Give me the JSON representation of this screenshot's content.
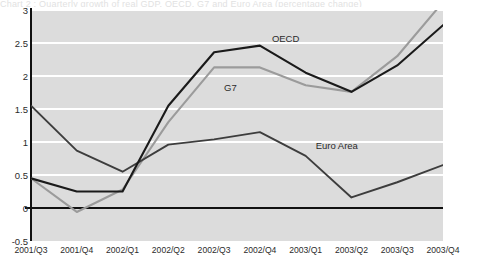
{
  "clipped_title": "Chart 2 : Quarterly growth of real GDP, OECD, G7 and Euro Area (percentage change)",
  "chart_data": {
    "type": "line",
    "title": "",
    "xlabel": "",
    "ylabel": "",
    "categories": [
      "2001/Q3",
      "2001/Q4",
      "2002/Q1",
      "2002/Q2",
      "2002/Q3",
      "2002/Q4",
      "2003/Q1",
      "2003/Q2",
      "2003/Q3",
      "2003/Q4"
    ],
    "ylim": [
      -0.5,
      3
    ],
    "yticks": [
      -0.5,
      0,
      0.5,
      1,
      1.5,
      2,
      2.5,
      3
    ],
    "ytick_labels": [
      "-0.5",
      "0",
      "0.5",
      "1",
      "1.5",
      "2",
      "2.5",
      "3"
    ],
    "grid": true,
    "grid_axis": "y",
    "legend_position": "inline-annotations",
    "zero_line": 0,
    "plot_background": "#dcdcdc",
    "grid_color": "#ffffff",
    "series": [
      {
        "name": "OECD",
        "color": "#1a1a1a",
        "width": 2.1,
        "values": [
          0.45,
          0.25,
          0.25,
          1.55,
          2.36,
          2.46,
          2.05,
          1.76,
          2.16,
          2.77
        ],
        "label_x": "2002/Q4",
        "label_value": 2.5
      },
      {
        "name": "G7",
        "color": "#9b9b9b",
        "width": 2.1,
        "values": [
          0.45,
          -0.06,
          0.28,
          1.3,
          2.13,
          2.13,
          1.86,
          1.76,
          2.3,
          3.12
        ],
        "label_x": "2002/Q3",
        "label_value": 1.87
      },
      {
        "name": "Euro Area",
        "color": "#3d3d3d",
        "width": 1.9,
        "values": [
          1.55,
          0.87,
          0.55,
          0.96,
          1.04,
          1.15,
          0.79,
          0.16,
          0.39,
          0.65
        ],
        "label_x": "2003/Q1",
        "label_value": 0.97
      }
    ]
  }
}
